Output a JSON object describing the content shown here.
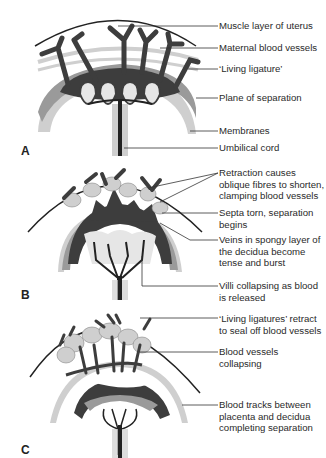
{
  "panels": [
    {
      "letter": "A",
      "labels": [
        {
          "text": "Muscle layer of uterus"
        },
        {
          "text": "Maternal blood vessels"
        },
        {
          "text": "‘Living ligature’"
        },
        {
          "text": "Plane of separation"
        },
        {
          "text": "Membranes"
        },
        {
          "text": "Umbilical cord"
        }
      ]
    },
    {
      "letter": "B",
      "labels": [
        {
          "text": "Retraction causes\noblique fibres to shorten,\nclamping blood vessels"
        },
        {
          "text": "Septa torn, separation\nbegins"
        },
        {
          "text": "Veins in spongy layer of\nthe decidua become\ntense and burst"
        },
        {
          "text": "Villi collapsing as blood\nis released"
        }
      ]
    },
    {
      "letter": "C",
      "labels": [
        {
          "text": "‘Living ligatures’ retract\nto seal off blood vessels"
        },
        {
          "text": "Blood vessels\ncollapsing"
        },
        {
          "text": "Blood tracks between\nplacenta and decidua\ncompleting separation"
        }
      ]
    }
  ],
  "colors": {
    "dark_blood": "#3d3d3d",
    "mid_tissue": "#9a9a9a",
    "light_tissue": "#cfcfcf",
    "pale": "#e6e6e6",
    "line": "#333333"
  }
}
